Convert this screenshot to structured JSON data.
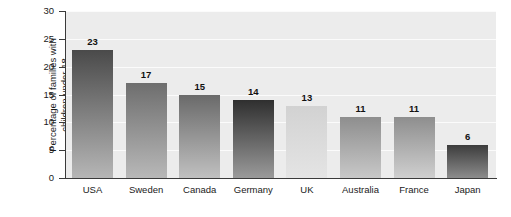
{
  "chart_data": {
    "type": "bar",
    "title": "",
    "xlabel": "",
    "ylabel": "Percentage of families with children under 18",
    "ylabel_line1": "Percentage of families with",
    "ylabel_line2": "children under 18",
    "categories": [
      "USA",
      "Sweden",
      "Canada",
      "Germany",
      "UK",
      "Australia",
      "France",
      "Japan"
    ],
    "values": [
      23,
      17,
      15,
      14,
      13,
      11,
      11,
      6
    ],
    "ylim": [
      0,
      30
    ],
    "ytick_labels": [
      "0",
      "5",
      "10",
      "15",
      "20",
      "25",
      "30"
    ],
    "ytick_values": [
      0,
      5,
      10,
      15,
      20,
      25,
      30
    ],
    "grid": "horizontal-white-gridlines",
    "legend": "none",
    "bar_colors_top": [
      "#4a4a4a",
      "#6e6e6e",
      "#6a6a6a",
      "#2f2f2f",
      "#d2d2d2",
      "#8e8e8e",
      "#8e8e8e",
      "#3c3c3c"
    ],
    "bar_colors_bottom": [
      "#b6b6b6",
      "#b8b8b8",
      "#c0c0c0",
      "#9a9a9a",
      "#e4e4e4",
      "#c8c8c8",
      "#cfcfcf",
      "#8c8c8c"
    ],
    "plot_background": "#ececec",
    "gridline_color": "#fbfbfb",
    "axis_color": "#3a3a3a",
    "page_background": "#ffffff"
  }
}
